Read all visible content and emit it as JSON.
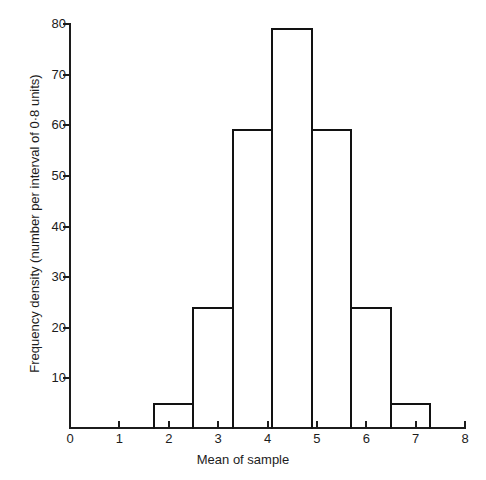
{
  "chart_data": {
    "type": "bar",
    "title": "",
    "subtitle": "",
    "xlabel": "Mean of sample",
    "ylabel": "Frequency density (number per interval of 0·8 units)",
    "xlim": [
      0,
      8
    ],
    "ylim": [
      0,
      80
    ],
    "grid": false,
    "legend": "none",
    "bin_width": 0.8,
    "bin_edges": [
      1.7,
      2.5,
      3.3,
      4.1,
      4.9,
      5.7,
      6.5,
      7.3
    ],
    "categories": [
      "1.7–2.5",
      "2.5–3.3",
      "3.3–4.1",
      "4.1–4.9",
      "4.9–5.7",
      "5.7–6.5",
      "6.5–7.3"
    ],
    "bin_centers": [
      2.1,
      2.9,
      3.7,
      4.5,
      5.3,
      6.1,
      6.9
    ],
    "values": [
      5,
      24,
      59,
      79,
      59,
      24,
      5
    ],
    "x_ticks": [
      0,
      1,
      2,
      3,
      4,
      5,
      6,
      7,
      8
    ],
    "x_tick_labels": [
      "0",
      "1",
      "2",
      "3",
      "4",
      "5",
      "6",
      "7",
      "8"
    ],
    "y_ticks": [
      0,
      10,
      20,
      30,
      40,
      50,
      60,
      70,
      80
    ],
    "y_tick_labels": [
      "0",
      "10",
      "20",
      "30",
      "40",
      "50",
      "60",
      "70",
      "80"
    ],
    "bar_style": {
      "fill": "none",
      "edge_color": "#121212",
      "edge_width": 2
    }
  },
  "axes": {
    "x_title": "Mean of sample",
    "y_title": "Frequency density (number per interval of 0·8 units)",
    "axis_color": "#1c1c1c"
  }
}
